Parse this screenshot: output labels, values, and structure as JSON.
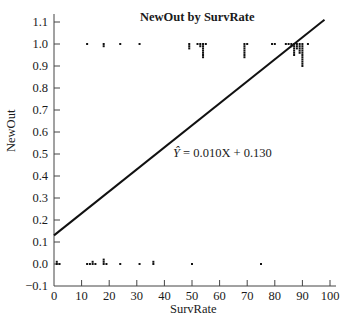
{
  "chart_data": {
    "type": "scatter",
    "title": "NewOut by SurvRate",
    "xlabel": "SurvRate",
    "ylabel": "NewOut",
    "xlim": [
      0,
      100
    ],
    "ylim": [
      -0.1,
      1.1
    ],
    "x_ticks": [
      0,
      10,
      20,
      30,
      40,
      50,
      60,
      70,
      80,
      90,
      100
    ],
    "y_ticks": [
      -0.1,
      0.0,
      0.1,
      0.2,
      0.3,
      0.4,
      0.5,
      0.6,
      0.7,
      0.8,
      0.9,
      1.0,
      1.1
    ],
    "x_tick_labels": [
      "0",
      "10",
      "20",
      "30",
      "40",
      "50",
      "60",
      "70",
      "80",
      "90",
      "100"
    ],
    "y_tick_labels": [
      "−0.1",
      "0.0",
      "0.1",
      "0.2",
      "0.3",
      "0.4",
      "0.5",
      "0.6",
      "0.7",
      "0.8",
      "0.9",
      "1.0",
      "1.1"
    ],
    "grid": false,
    "series": [
      {
        "name": "NewOut = 1",
        "points": [
          [
            12,
            1.0
          ],
          [
            18,
            1.0
          ],
          [
            18,
            0.99
          ],
          [
            24,
            1.0
          ],
          [
            31,
            1.0
          ],
          [
            49,
            1.0
          ],
          [
            49,
            0.99
          ],
          [
            49,
            0.98
          ],
          [
            52,
            1.0
          ],
          [
            53,
            1.0
          ],
          [
            53,
            0.99
          ],
          [
            54,
            1.0
          ],
          [
            54,
            0.99
          ],
          [
            54,
            0.98
          ],
          [
            54,
            0.97
          ],
          [
            54,
            0.96
          ],
          [
            54,
            0.95
          ],
          [
            54,
            0.94
          ],
          [
            55,
            1.0
          ],
          [
            69,
            1.0
          ],
          [
            69,
            0.99
          ],
          [
            69,
            0.98
          ],
          [
            69,
            0.97
          ],
          [
            69,
            0.96
          ],
          [
            69,
            0.95
          ],
          [
            69,
            0.94
          ],
          [
            70,
            1.0
          ],
          [
            79,
            1.0
          ],
          [
            80,
            1.0
          ],
          [
            84,
            1.0
          ],
          [
            85,
            1.0
          ],
          [
            86,
            1.0
          ],
          [
            86,
            0.99
          ],
          [
            87,
            1.0
          ],
          [
            87,
            0.99
          ],
          [
            87,
            0.98
          ],
          [
            87,
            0.97
          ],
          [
            87,
            0.96
          ],
          [
            87,
            0.95
          ],
          [
            88,
            1.0
          ],
          [
            88,
            0.99
          ],
          [
            88,
            0.98
          ],
          [
            89,
            1.0
          ],
          [
            89,
            0.99
          ],
          [
            89,
            0.98
          ],
          [
            89,
            0.97
          ],
          [
            89,
            0.96
          ],
          [
            90,
            1.0
          ],
          [
            90,
            0.99
          ],
          [
            90,
            0.98
          ],
          [
            90,
            0.97
          ],
          [
            90,
            0.96
          ],
          [
            90,
            0.95
          ],
          [
            90,
            0.94
          ],
          [
            90,
            0.93
          ],
          [
            90,
            0.92
          ],
          [
            90,
            0.91
          ],
          [
            90,
            0.9
          ],
          [
            92,
            1.0
          ]
        ]
      },
      {
        "name": "NewOut = 0",
        "points": [
          [
            1,
            0.0
          ],
          [
            1,
            0.01
          ],
          [
            2,
            0.0
          ],
          [
            12,
            0.0
          ],
          [
            13,
            0.0
          ],
          [
            14,
            0.0
          ],
          [
            14,
            0.01
          ],
          [
            15,
            0.0
          ],
          [
            18,
            0.0
          ],
          [
            18,
            0.01
          ],
          [
            18,
            0.02
          ],
          [
            19,
            0.0
          ],
          [
            24,
            0.0
          ],
          [
            31,
            0.0
          ],
          [
            36,
            0.0
          ],
          [
            36,
            0.01
          ],
          [
            50,
            0.0
          ],
          [
            75,
            0.0
          ]
        ]
      }
    ],
    "regression_line": {
      "equation": "Ŷ = 0.010X + 0.130",
      "slope": 0.01,
      "intercept": 0.13,
      "x_range": [
        0,
        98
      ]
    },
    "annotations": [
      {
        "text": "Ŷ = 0.010X + 0.130",
        "x": 54,
        "y": 0.53
      }
    ]
  },
  "labels": {
    "title": "NewOut by SurvRate",
    "xlabel": "SurvRate",
    "ylabel": "NewOut",
    "equation_yhat": "Ŷ",
    "equation_rest": " = 0.010X + 0.130"
  }
}
